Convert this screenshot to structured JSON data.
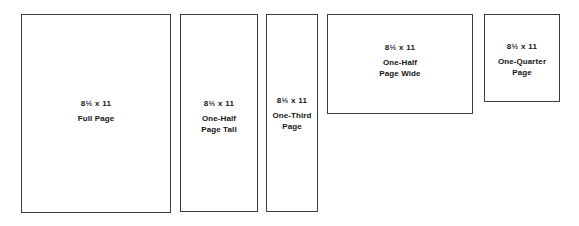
{
  "diagram": {
    "background_color": "#ffffff",
    "border_color": "#3b3b3b",
    "text_color": "#141414",
    "boxes": [
      {
        "id": "full-page",
        "dimensions": "8½ x 11",
        "name_line_1": "Full Page",
        "name_line_2": "",
        "x": 21,
        "y": 14,
        "width": 150,
        "height": 199
      },
      {
        "id": "half-page-tall",
        "dimensions": "8½ x 11",
        "name_line_1": "One-Half",
        "name_line_2": "Page Tall",
        "x": 180,
        "y": 14,
        "width": 78,
        "height": 198
      },
      {
        "id": "third-page",
        "dimensions": "8½ x 11",
        "name_line_1": "One-Third",
        "name_line_2": "Page",
        "x": 266,
        "y": 14,
        "width": 52,
        "height": 198
      },
      {
        "id": "half-page-wide",
        "dimensions": "8½ x 11",
        "name_line_1": "One-Half",
        "name_line_2": "Page Wide",
        "x": 327,
        "y": 14,
        "width": 146,
        "height": 100
      },
      {
        "id": "quarter-page",
        "dimensions": "8½ x 11",
        "name_line_1": "One-Quarter",
        "name_line_2": "Page",
        "x": 484,
        "y": 14,
        "width": 76,
        "height": 88
      }
    ]
  }
}
